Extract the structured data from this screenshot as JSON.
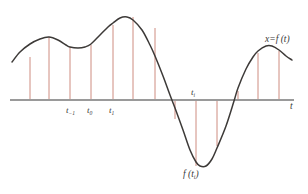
{
  "figure": {
    "title_text": "",
    "axis_label_t": "t",
    "curve_label": "x=f (t)",
    "colors": {
      "curve": "#3d3a38",
      "ordinate": "#c87f72",
      "axis": "#9a9a9a",
      "background": "#ffffff",
      "text": "#3a3a3a"
    },
    "tick_labels": [
      {
        "name": "t-minus-1",
        "text": "t",
        "sub": "−1"
      },
      {
        "name": "t-zero",
        "text": "t",
        "sub": "0"
      },
      {
        "name": "t-one",
        "text": "t",
        "sub": "1"
      },
      {
        "name": "t-i",
        "text": "t",
        "sub": "i"
      }
    ],
    "value_label": {
      "text": "f (t",
      "sub": "i",
      "tail": ")"
    }
  },
  "chart_data": {
    "type": "line",
    "title": "",
    "xlabel": "t",
    "ylabel": "x",
    "curve_label": "x=f (t)",
    "grid": false,
    "legend": "none",
    "xlim": [
      0,
      308
    ],
    "ylim": [
      194,
      0
    ],
    "axis_y_pixel": 100,
    "annotations": [
      {
        "label": "t−1",
        "x_pixel": 70,
        "kind": "tick-label"
      },
      {
        "label": "t0",
        "x_pixel": 91,
        "kind": "tick-label"
      },
      {
        "label": "t1",
        "x_pixel": 113,
        "kind": "tick-label"
      },
      {
        "label": "ti",
        "x_pixel": 196,
        "kind": "tick-label"
      },
      {
        "label": "f (ti)",
        "x_pixel": 197,
        "y_pixel": 172,
        "kind": "value-label"
      },
      {
        "label": "x=f (t)",
        "x_pixel": 272,
        "y_pixel": 40,
        "kind": "curve-label"
      },
      {
        "label": "t",
        "x_pixel": 292,
        "y_pixel": 104,
        "kind": "axis-label"
      }
    ],
    "ordinate_lines_x": [
      30,
      49,
      70,
      91,
      113,
      133,
      155,
      175,
      196,
      217,
      238,
      258,
      279
    ],
    "ordinate_line_tops": [
      57,
      37,
      47,
      45,
      25,
      17,
      28,
      119,
      166,
      146,
      91,
      53,
      51
    ],
    "curve_samples": [
      {
        "x": 12,
        "y": 62
      },
      {
        "x": 20,
        "y": 52
      },
      {
        "x": 30,
        "y": 44
      },
      {
        "x": 40,
        "y": 39
      },
      {
        "x": 49,
        "y": 37
      },
      {
        "x": 58,
        "y": 40
      },
      {
        "x": 66,
        "y": 45
      },
      {
        "x": 70,
        "y": 47
      },
      {
        "x": 78,
        "y": 48
      },
      {
        "x": 85,
        "y": 47
      },
      {
        "x": 91,
        "y": 44
      },
      {
        "x": 100,
        "y": 35
      },
      {
        "x": 108,
        "y": 27
      },
      {
        "x": 113,
        "y": 23
      },
      {
        "x": 120,
        "y": 18
      },
      {
        "x": 127,
        "y": 17
      },
      {
        "x": 133,
        "y": 20
      },
      {
        "x": 142,
        "y": 30
      },
      {
        "x": 150,
        "y": 45
      },
      {
        "x": 155,
        "y": 56
      },
      {
        "x": 163,
        "y": 76
      },
      {
        "x": 170,
        "y": 95
      },
      {
        "x": 175,
        "y": 108
      },
      {
        "x": 183,
        "y": 130
      },
      {
        "x": 190,
        "y": 150
      },
      {
        "x": 196,
        "y": 162
      },
      {
        "x": 200,
        "y": 166
      },
      {
        "x": 206,
        "y": 166
      },
      {
        "x": 212,
        "y": 159
      },
      {
        "x": 217,
        "y": 148
      },
      {
        "x": 226,
        "y": 126
      },
      {
        "x": 234,
        "y": 101
      },
      {
        "x": 238,
        "y": 88
      },
      {
        "x": 246,
        "y": 69
      },
      {
        "x": 253,
        "y": 57
      },
      {
        "x": 258,
        "y": 51
      },
      {
        "x": 266,
        "y": 46
      },
      {
        "x": 272,
        "y": 46
      },
      {
        "x": 279,
        "y": 50
      },
      {
        "x": 286,
        "y": 56
      },
      {
        "x": 292,
        "y": 60
      }
    ]
  }
}
